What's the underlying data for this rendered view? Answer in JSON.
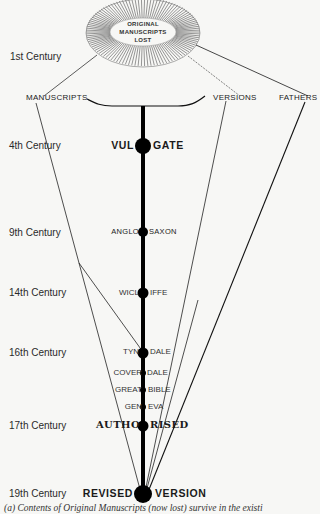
{
  "origin": {
    "label_lines": [
      "ORIGINAL",
      "MANUSCRIPTS",
      "LOST"
    ]
  },
  "sources": {
    "manuscripts": "MANUSCRIPTS",
    "versions": "VERSIONS",
    "fathers": "FATHERS"
  },
  "centuries": {
    "c1": "1st Century",
    "c4": "4th Century",
    "c9": "9th Century",
    "c14": "14th Century",
    "c16": "16th Century",
    "c17": "17th Century",
    "c19": "19th Century"
  },
  "versions": [
    {
      "left": "VUL",
      "right": "GATE",
      "century": "4th Century"
    },
    {
      "left": "ANGLO",
      "right": "SAXON",
      "century": "9th Century"
    },
    {
      "left": "WICL",
      "right": "IFFE",
      "century": "14th Century"
    },
    {
      "left": "TYN",
      "right": "DALE",
      "century": "16th Century"
    },
    {
      "left": "COVER",
      "right": "DALE",
      "century": "16th Century"
    },
    {
      "left": "GREAT",
      "right": "BIBLE",
      "century": "16th Century"
    },
    {
      "left": "GEN",
      "right": "EVA",
      "century": "16th Century"
    },
    {
      "left": "AUTHO",
      "right": "RISED",
      "century": "17th Century"
    },
    {
      "left": "REVISED",
      "right": "VERSION",
      "century": "19th Century"
    }
  ],
  "caption": "(a)  Contents of Original Manuscripts (now lost) survive in the existi"
}
